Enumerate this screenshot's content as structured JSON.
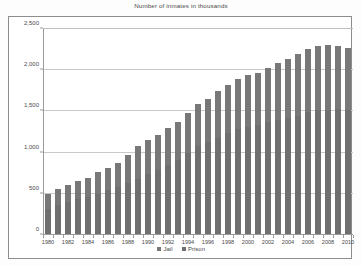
{
  "chart_data": {
    "type": "bar",
    "barmode": "stacked",
    "title": "Number of inmates in thousands",
    "xlabel": "",
    "ylabel": "",
    "ylim": [
      0,
      2500
    ],
    "yticks": [
      0,
      500,
      1000,
      1500,
      2000,
      2500
    ],
    "ytick_labels": [
      "0",
      "500",
      "1,000",
      "1,500",
      "2,000",
      "2,500"
    ],
    "grid": true,
    "legend_position": "bottom-center",
    "categories": [
      "1980",
      "1981",
      "1982",
      "1983",
      "1984",
      "1985",
      "1986",
      "1987",
      "1988",
      "1989",
      "1990",
      "1991",
      "1992",
      "1993",
      "1994",
      "1995",
      "1996",
      "1997",
      "1998",
      "1999",
      "2000",
      "2001",
      "2002",
      "2003",
      "2004",
      "2005",
      "2006",
      "2007",
      "2008",
      "2009",
      "2010"
    ],
    "xtick_labels": [
      "1980",
      "1982",
      "1984",
      "1986",
      "1988",
      "1990",
      "1992",
      "1994",
      "1996",
      "1998",
      "2000",
      "2002",
      "2004",
      "2006",
      "2008",
      "2010"
    ],
    "series": [
      {
        "name": "Jail",
        "color": "#787878",
        "values": [
          183,
          196,
          209,
          223,
          234,
          256,
          274,
          295,
          343,
          395,
          405,
          426,
          444,
          459,
          486,
          507,
          518,
          567,
          592,
          605,
          621,
          631,
          665,
          691,
          714,
          747,
          766,
          780,
          785,
          767,
          749
        ]
      },
      {
        "name": "Prison",
        "color": "#6f6f6f",
        "values": [
          316,
          360,
          402,
          437,
          464,
          503,
          545,
          585,
          628,
          683,
          743,
          793,
          850,
          910,
          990,
          1078,
          1128,
          1177,
          1232,
          1287,
          1316,
          1330,
          1367,
          1391,
          1422,
          1448,
          1492,
          1517,
          1519,
          1525,
          1518
        ]
      }
    ],
    "totals": [
      499,
      556,
      611,
      660,
      698,
      759,
      819,
      880,
      971,
      1078,
      1148,
      1219,
      1294,
      1369,
      1476,
      1585,
      1646,
      1744,
      1824,
      1892,
      1937,
      1961,
      2032,
      2082,
      2136,
      2195,
      2258,
      2297,
      2304,
      2292,
      2267
    ]
  },
  "legend": {
    "items": [
      {
        "label": "Jail"
      },
      {
        "label": "Prison"
      }
    ]
  }
}
